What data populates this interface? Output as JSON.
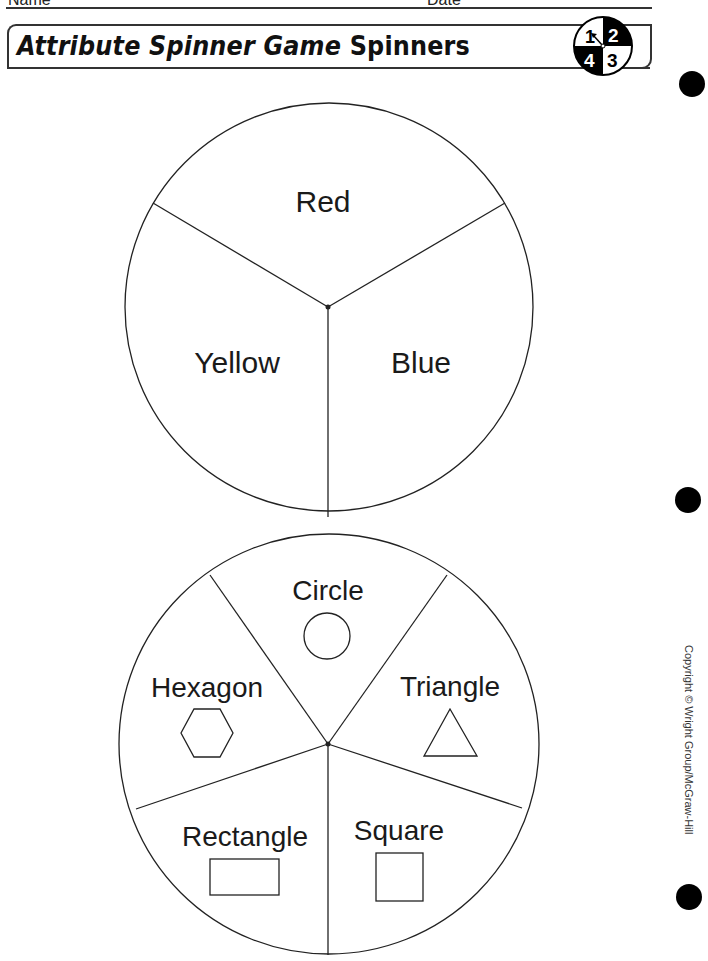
{
  "header": {
    "name_label": "Name",
    "date_label": "Date"
  },
  "title": {
    "italic_part": "Attribute Spinner Game",
    "plain_part": "Spinners"
  },
  "spinner_icon": {
    "numbers": [
      "1",
      "2",
      "3",
      "4"
    ]
  },
  "color_spinner": {
    "sections": [
      {
        "label": "Red"
      },
      {
        "label": "Yellow"
      },
      {
        "label": "Blue"
      }
    ]
  },
  "shape_spinner": {
    "sections": [
      {
        "label": "Circle",
        "shape": "circle"
      },
      {
        "label": "Triangle",
        "shape": "triangle"
      },
      {
        "label": "Square",
        "shape": "square"
      },
      {
        "label": "Rectangle",
        "shape": "rectangle"
      },
      {
        "label": "Hexagon",
        "shape": "hexagon"
      }
    ]
  },
  "copyright": "Copyright © Wright Group/McGraw-Hill"
}
